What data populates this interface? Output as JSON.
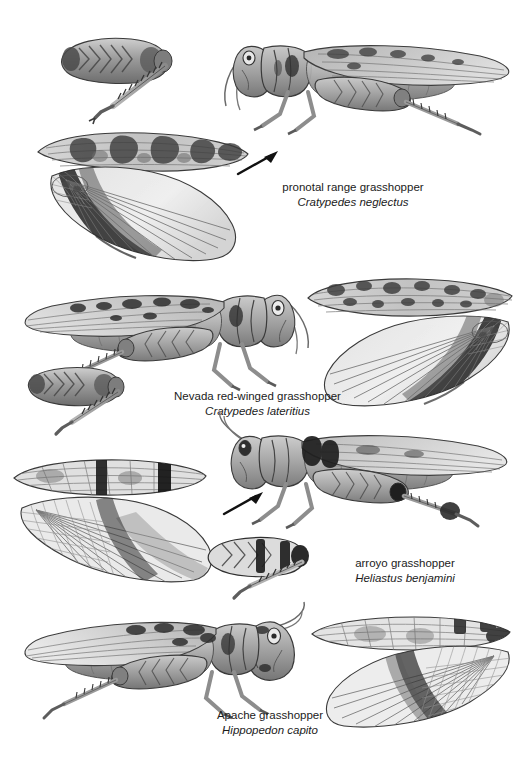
{
  "plate": {
    "title": "Grasshopper species identification plate",
    "background_color": "#ffffff",
    "ink_color": "#1b1b1b",
    "medium": "graphite pencil scientific illustration",
    "width": 524,
    "height": 770
  },
  "species": [
    {
      "index": 1,
      "common_name": "pronotal range grasshopper",
      "scientific_name": "Cratypedes neglectus",
      "caption_x": 268,
      "caption_y": 180,
      "caption_width": 170,
      "body_orientation": "facing-left",
      "parts": [
        {
          "name": "hind-leg-inset",
          "x": 55,
          "y": 28,
          "w": 140,
          "h": 95
        },
        {
          "name": "whole-body-lateral",
          "x": 225,
          "y": 22,
          "w": 285,
          "h": 120
        },
        {
          "name": "tegmen-forewing",
          "x": 36,
          "y": 128,
          "w": 215,
          "h": 48
        },
        {
          "name": "hindwing-fan",
          "x": 46,
          "y": 164,
          "w": 195,
          "h": 100
        }
      ],
      "arrow": {
        "x": 236,
        "y": 150,
        "w": 46,
        "h": 28,
        "direction": "up-right"
      },
      "hindwing_pattern": "dark banded fan with pale radiating veins",
      "tegmen_pattern": "mottled with dark blotches"
    },
    {
      "index": 2,
      "common_name": "Nevada red-winged grasshopper",
      "scientific_name": "Cratypedes lateritius",
      "caption_x": 160,
      "caption_y": 389,
      "caption_width": 195,
      "body_orientation": "facing-right",
      "parts": [
        {
          "name": "whole-body-lateral",
          "x": 22,
          "y": 276,
          "w": 285,
          "h": 125
        },
        {
          "name": "hind-leg-inset",
          "x": 26,
          "y": 362,
          "w": 130,
          "h": 72
        },
        {
          "name": "tegmen-forewing",
          "x": 306,
          "y": 276,
          "w": 205,
          "h": 45
        },
        {
          "name": "hindwing-fan",
          "x": 318,
          "y": 312,
          "w": 195,
          "h": 95
        }
      ],
      "arrow": null,
      "hindwing_pattern": "dark banded fan, pale distal margin",
      "tegmen_pattern": "speckled with dark spots"
    },
    {
      "index": 3,
      "common_name": "arroyo grasshopper",
      "scientific_name": "Heliastus benjamini",
      "caption_x": 330,
      "caption_y": 556,
      "caption_width": 150,
      "body_orientation": "facing-left",
      "parts": [
        {
          "name": "whole-body-lateral",
          "x": 222,
          "y": 414,
          "w": 290,
          "h": 130
        },
        {
          "name": "tegmen-forewing",
          "x": 12,
          "y": 458,
          "w": 190,
          "h": 42
        },
        {
          "name": "hindwing-fan",
          "x": 18,
          "y": 494,
          "w": 195,
          "h": 88
        },
        {
          "name": "hind-leg-inset",
          "x": 206,
          "y": 532,
          "w": 120,
          "h": 68
        }
      ],
      "arrow": {
        "x": 222,
        "y": 490,
        "w": 44,
        "h": 28,
        "direction": "up-right"
      },
      "hindwing_pattern": "reticulated basal cells with dark cross bands",
      "tegmen_pattern": "two bold dark transverse bars"
    },
    {
      "index": 4,
      "common_name": "Apache grasshopper",
      "scientific_name": "Hippopedon capito",
      "caption_x": 180,
      "caption_y": 708,
      "caption_width": 180,
      "body_orientation": "facing-right",
      "parts": [
        {
          "name": "whole-body-lateral",
          "x": 26,
          "y": 602,
          "w": 275,
          "h": 130
        },
        {
          "name": "tegmen-forewing",
          "x": 310,
          "y": 614,
          "w": 200,
          "h": 40
        },
        {
          "name": "hindwing-fan",
          "x": 318,
          "y": 645,
          "w": 195,
          "h": 80
        }
      ],
      "arrow": null,
      "hindwing_pattern": "pale fan with dark median band",
      "tegmen_pattern": "pale with dark patches near apex"
    }
  ]
}
